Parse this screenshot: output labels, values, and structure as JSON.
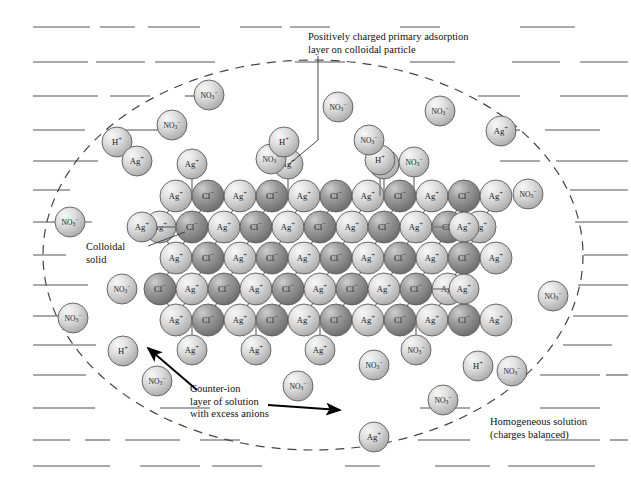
{
  "figure": {
    "width": 631,
    "height": 485,
    "background_color": "#ffffff"
  },
  "annotations": [
    {
      "name": "adsorption-layer-label",
      "text": "Positively charged primary adsorption\nlayer on colloidal particle",
      "x": 308,
      "y": 31,
      "leader": [
        [
          318,
          56
        ],
        [
          318,
          140
        ],
        [
          288,
          165
        ]
      ]
    },
    {
      "name": "colloidal-solid-label",
      "text": "Colloidal\nsolid",
      "x": 86,
      "y": 241,
      "leader": [
        [
          148,
          246
        ],
        [
          185,
          232
        ]
      ]
    },
    {
      "name": "counter-ion-label",
      "text": "Counter-ion\nlayer of solution\nwith excess anions",
      "x": 190,
      "y": 383,
      "arrows": [
        {
          "from": [
            197,
            390
          ],
          "to": [
            148,
            348
          ]
        },
        {
          "from": [
            268,
            405
          ],
          "to": [
            340,
            410
          ]
        }
      ]
    },
    {
      "name": "homogeneous-solution-label",
      "text": "Homogeneous solution\n(charges balanced)",
      "x": 490,
      "y": 416
    }
  ],
  "boundary": {
    "name": "diffuse-layer-boundary",
    "shape": "ellipse",
    "cx": 313,
    "cy": 255,
    "rx": 270,
    "ry": 195,
    "style": "dashed",
    "color": "#444444"
  },
  "colors": {
    "cation_light": "#d9d9d9",
    "cation_highlight": "#f4f4f4",
    "cation_shadow": "#a8a8a8",
    "anion_dark": "#9a9a9a",
    "anion_highlight": "#c8c8c8",
    "anion_shadow": "#6a6a6a",
    "outline": "#5a5a5a",
    "bond": "#777777",
    "hatch": "#555555",
    "text": "#111111"
  },
  "ion_species": {
    "silver": {
      "label": "Ag",
      "charge": "+",
      "name": "silver-ion",
      "tone": "light"
    },
    "chloride": {
      "label": "Cl",
      "charge": "−",
      "name": "chloride-ion",
      "tone": "dark"
    },
    "nitrate": {
      "label": "NO",
      "sub": "3",
      "charge": "−",
      "name": "nitrate-ion",
      "tone": "light"
    },
    "hydrogen": {
      "label": "H",
      "charge": "+",
      "name": "hydrogen-ion",
      "tone": "light"
    }
  },
  "lattice": {
    "name": "silver-chloride-crystal-lattice",
    "origin_x": 176,
    "origin_y": 196,
    "spacing_x": 32,
    "spacing_y": 31,
    "radius": 16,
    "rows": [
      {
        "start_offset": 0,
        "ions": [
          "Ag",
          "Cl",
          "Ag",
          "Cl",
          "Ag",
          "Cl",
          "Ag",
          "Cl",
          "Ag",
          "Cl",
          "Ag"
        ]
      },
      {
        "start_offset": -16,
        "ions": [
          "Ag",
          "Cl",
          "Ag",
          "Cl",
          "Ag",
          "Cl",
          "Ag",
          "Cl",
          "Ag",
          "Cl",
          "Ag"
        ]
      },
      {
        "start_offset": 0,
        "ions": [
          "Ag",
          "Cl",
          "Ag",
          "Cl",
          "Ag",
          "Cl",
          "Ag",
          "Cl",
          "Ag",
          "Cl",
          "Ag"
        ]
      },
      {
        "start_offset": -16,
        "ions": [
          "Cl",
          "Ag",
          "Cl",
          "Ag",
          "Cl",
          "Ag",
          "Cl",
          "Ag",
          "Cl",
          "Ag"
        ]
      },
      {
        "start_offset": 0,
        "ions": [
          "Ag",
          "Cl",
          "Ag",
          "Cl",
          "Ag",
          "Cl",
          "Ag",
          "Cl",
          "Ag",
          "Cl",
          "Ag"
        ]
      }
    ]
  },
  "adsorbed_ions": [
    {
      "species": "silver",
      "x": 192,
      "y": 164,
      "r": 15,
      "bonded_to": [
        192,
        196
      ]
    },
    {
      "species": "silver",
      "x": 288,
      "y": 164,
      "r": 15,
      "bonded_to": [
        288,
        196
      ]
    },
    {
      "species": "silver",
      "x": 384,
      "y": 164,
      "r": 15,
      "bonded_to": [
        384,
        196
      ]
    },
    {
      "species": "hydrogen",
      "x": 384,
      "y": 164,
      "r": 0,
      "hidden": true
    },
    {
      "species": "silver",
      "x": 192,
      "y": 350,
      "r": 15,
      "bonded_to": [
        192,
        320
      ]
    },
    {
      "species": "silver",
      "x": 256,
      "y": 350,
      "r": 15,
      "bonded_to": [
        256,
        320
      ]
    },
    {
      "species": "silver",
      "x": 320,
      "y": 350,
      "r": 15,
      "bonded_to": [
        320,
        320
      ]
    },
    {
      "species": "nitrate",
      "x": 416,
      "y": 350,
      "r": 15,
      "bonded_to": [
        416,
        320
      ]
    },
    {
      "species": "hydrogen",
      "x": 380,
      "y": 160,
      "r": 15,
      "bonded_to": [
        380,
        196
      ]
    },
    {
      "species": "nitrate",
      "x": 414,
      "y": 162,
      "r": 15,
      "bonded_to": [
        414,
        196
      ]
    },
    {
      "species": "silver",
      "x": 142,
      "y": 227,
      "r": 15,
      "bonded_to": [
        176,
        227
      ]
    },
    {
      "species": "silver",
      "x": 464,
      "y": 227,
      "r": 15,
      "bonded_to": [
        432,
        227
      ]
    },
    {
      "species": "silver",
      "x": 464,
      "y": 289,
      "r": 15,
      "bonded_to": [
        432,
        289
      ]
    },
    {
      "species": "silver",
      "x": 464,
      "y": 258,
      "r": 0,
      "hidden": true
    }
  ],
  "free_ions": [
    {
      "species": "nitrate",
      "x": 209,
      "y": 95,
      "r": 15
    },
    {
      "species": "nitrate",
      "x": 172,
      "y": 125,
      "r": 15
    },
    {
      "species": "hydrogen",
      "x": 117,
      "y": 142,
      "r": 15
    },
    {
      "species": "silver",
      "x": 137,
      "y": 161,
      "r": 15
    },
    {
      "species": "nitrate",
      "x": 338,
      "y": 107,
      "r": 15
    },
    {
      "species": "nitrate",
      "x": 369,
      "y": 140,
      "r": 15
    },
    {
      "species": "nitrate",
      "x": 440,
      "y": 111,
      "r": 15
    },
    {
      "species": "silver",
      "x": 501,
      "y": 131,
      "r": 15
    },
    {
      "species": "nitrate",
      "x": 271,
      "y": 159,
      "r": 15
    },
    {
      "species": "hydrogen",
      "x": 284,
      "y": 142,
      "r": 15
    },
    {
      "species": "nitrate",
      "x": 528,
      "y": 194,
      "r": 15
    },
    {
      "species": "nitrate",
      "x": 70,
      "y": 222,
      "r": 15
    },
    {
      "species": "nitrate",
      "x": 122,
      "y": 289,
      "r": 15
    },
    {
      "species": "nitrate",
      "x": 553,
      "y": 296,
      "r": 15
    },
    {
      "species": "nitrate",
      "x": 73,
      "y": 318,
      "r": 15
    },
    {
      "species": "hydrogen",
      "x": 123,
      "y": 351,
      "r": 15
    },
    {
      "species": "nitrate",
      "x": 157,
      "y": 381,
      "r": 15
    },
    {
      "species": "nitrate",
      "x": 298,
      "y": 386,
      "r": 15
    },
    {
      "species": "nitrate",
      "x": 374,
      "y": 365,
      "r": 15
    },
    {
      "species": "hydrogen",
      "x": 478,
      "y": 366,
      "r": 15
    },
    {
      "species": "nitrate",
      "x": 512,
      "y": 371,
      "r": 15
    },
    {
      "species": "nitrate",
      "x": 443,
      "y": 400,
      "r": 15
    },
    {
      "species": "silver",
      "x": 374,
      "y": 437,
      "r": 15
    }
  ],
  "hatch_rows": [
    {
      "y": 27,
      "segments": [
        [
          33,
          90
        ],
        [
          100,
          135
        ],
        [
          148,
          200
        ],
        [
          240,
          282
        ],
        [
          290,
          330
        ],
        [
          400,
          440
        ],
        [
          520,
          575
        ]
      ]
    },
    {
      "y": 62,
      "segments": [
        [
          33,
          88
        ],
        [
          96,
          145
        ],
        [
          155,
          215
        ],
        [
          295,
          345
        ],
        [
          410,
          455
        ],
        [
          512,
          560
        ],
        [
          580,
          628
        ]
      ]
    },
    {
      "y": 96,
      "segments": [
        [
          33,
          98
        ],
        [
          110,
          150
        ],
        [
          185,
          215
        ],
        [
          478,
          520
        ],
        [
          560,
          628
        ]
      ]
    },
    {
      "y": 130,
      "segments": [
        [
          33,
          85
        ],
        [
          107,
          163
        ],
        [
          488,
          520
        ],
        [
          545,
          600
        ]
      ]
    },
    {
      "y": 161,
      "segments": [
        [
          33,
          98
        ],
        [
          500,
          540
        ],
        [
          556,
          628
        ]
      ]
    },
    {
      "y": 190,
      "segments": [
        [
          33,
          70
        ],
        [
          570,
          628
        ]
      ]
    },
    {
      "y": 222,
      "segments": [
        [
          33,
          92
        ],
        [
          575,
          628
        ]
      ]
    },
    {
      "y": 255,
      "segments": [
        [
          33,
          66
        ],
        [
          584,
          628
        ]
      ]
    },
    {
      "y": 285,
      "segments": [
        [
          33,
          88
        ],
        [
          578,
          628
        ]
      ]
    },
    {
      "y": 316,
      "segments": [
        [
          33,
          78
        ],
        [
          573,
          628
        ]
      ]
    },
    {
      "y": 345,
      "segments": [
        [
          33,
          96
        ],
        [
          563,
          612
        ]
      ]
    },
    {
      "y": 375,
      "segments": [
        [
          33,
          86
        ],
        [
          540,
          600
        ],
        [
          606,
          628
        ]
      ]
    },
    {
      "y": 408,
      "segments": [
        [
          33,
          95
        ],
        [
          160,
          210
        ],
        [
          420,
          470
        ],
        [
          540,
          600
        ]
      ]
    },
    {
      "y": 440,
      "segments": [
        [
          33,
          70
        ],
        [
          85,
          110
        ],
        [
          125,
          180
        ],
        [
          200,
          240
        ],
        [
          418,
          470
        ],
        [
          545,
          600
        ],
        [
          610,
          628
        ]
      ]
    },
    {
      "y": 466,
      "segments": [
        [
          33,
          110
        ],
        [
          140,
          200
        ],
        [
          212,
          262
        ],
        [
          345,
          380
        ],
        [
          435,
          490
        ],
        [
          508,
          595
        ]
      ]
    }
  ]
}
